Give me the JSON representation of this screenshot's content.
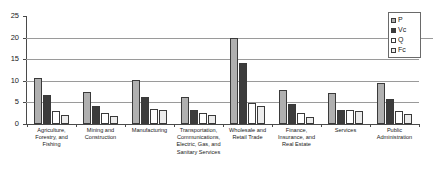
{
  "chart_data": {
    "type": "bar",
    "title": "",
    "subtitle": "",
    "xlabel": "",
    "ylabel": "",
    "ylim": [
      0,
      25
    ],
    "yticks": [
      0,
      5,
      10,
      15,
      20,
      25
    ],
    "ytick_labels": [
      "0",
      "5",
      "10",
      "15",
      "20",
      "25"
    ],
    "grid": true,
    "grid_axis": "y",
    "legend_position": "top-right",
    "categories": [
      "Agriculture, Forestry, and Fishing",
      "Mining and Construction",
      "Manufacturing",
      "Transportation, Communications, Electric, Gas, and Sanitary Services",
      "Wholesale and Retail Trade",
      "Finance, Insurance, and Real Estate",
      "Services",
      "Public Administration"
    ],
    "category_lines": [
      [
        "Agriculture,",
        "Forestry, and",
        "Fishing"
      ],
      [
        "Mining and",
        "Construction"
      ],
      [
        "Manufacturing"
      ],
      [
        "Transportation,",
        "Communications,",
        "Electric, Gas, and",
        "Sanitary Services"
      ],
      [
        "Wholesale and",
        "Retail Trade"
      ],
      [
        "Finance,",
        "Insurance, and",
        "Real Estate"
      ],
      [
        "Services"
      ],
      [
        "Public",
        "Administration"
      ]
    ],
    "series": [
      {
        "name": "P",
        "color": "#b0b0b0",
        "values": [
          10.6,
          7.4,
          10.1,
          6.3,
          20.0,
          7.9,
          7.1,
          9.5
        ]
      },
      {
        "name": "Vc",
        "color": "#3c3c3c",
        "values": [
          6.7,
          4.2,
          6.3,
          3.3,
          14.2,
          4.7,
          3.3,
          5.9
        ]
      },
      {
        "name": "Q",
        "color": "#ffffff",
        "values": [
          3.0,
          2.6,
          3.5,
          2.5,
          4.8,
          2.6,
          3.3,
          3.1
        ]
      },
      {
        "name": "Fc",
        "color": "#ececec",
        "values": [
          2.0,
          1.8,
          3.2,
          2.0,
          4.2,
          1.6,
          3.0,
          2.3
        ]
      }
    ]
  },
  "legend": {
    "entries": [
      {
        "label": "P",
        "swatch": "series-p-swatch"
      },
      {
        "label": "Vc",
        "swatch": "series-vc-swatch"
      },
      {
        "label": "Q",
        "swatch": "series-q-swatch"
      },
      {
        "label": "Fc",
        "swatch": "series-fc-swatch"
      }
    ]
  }
}
